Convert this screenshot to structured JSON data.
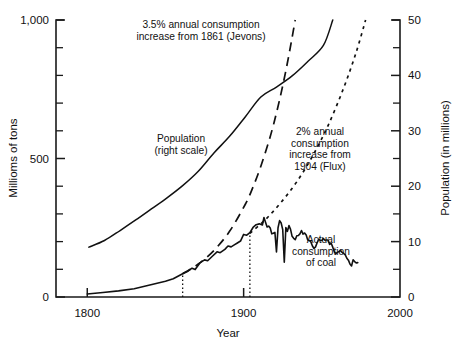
{
  "chart_data": {
    "type": "line",
    "title": "",
    "xlabel": "Year",
    "ylabel_left": "Millioms of tons",
    "ylabel_right": "Population (in millions)",
    "xlim": [
      1780,
      2000
    ],
    "xticks": [
      1800,
      1900,
      2000
    ],
    "xticklabels": [
      "1800",
      "1900",
      "2000"
    ],
    "ylim_left": [
      0,
      1000
    ],
    "yticks_left": [
      0,
      500,
      1000
    ],
    "yticklabels_left": [
      "0",
      "500",
      "1,000"
    ],
    "yticks_left_minor": [
      100,
      200,
      300,
      400,
      600,
      700,
      800,
      900
    ],
    "ylim_right": [
      0,
      50
    ],
    "yticks_right": [
      0,
      10,
      20,
      30,
      40,
      50
    ],
    "yticklabels_right": [
      "0",
      "10",
      "20",
      "30",
      "40",
      "50"
    ],
    "yticks_right_minor": [
      5,
      15,
      25,
      35,
      45
    ],
    "grid": false,
    "legend_position": "inline-annotations",
    "series": [
      {
        "name": "Population (right scale)",
        "style": "solid",
        "axis": "right",
        "units": "millions",
        "points": [
          [
            1801,
            9.0
          ],
          [
            1811,
            10.2
          ],
          [
            1821,
            12.0
          ],
          [
            1831,
            13.9
          ],
          [
            1841,
            15.9
          ],
          [
            1851,
            17.9
          ],
          [
            1861,
            20.1
          ],
          [
            1871,
            22.7
          ],
          [
            1881,
            26.0
          ],
          [
            1891,
            29.0
          ],
          [
            1901,
            32.5
          ],
          [
            1911,
            36.1
          ],
          [
            1921,
            37.9
          ],
          [
            1931,
            39.9
          ],
          [
            1941,
            42.5
          ],
          [
            1951,
            45.4
          ],
          [
            1957,
            50.0
          ]
        ]
      },
      {
        "name": "3.5% annual consumption increase from 1861 (Jevons)",
        "style": "dashed",
        "axis": "left",
        "units": "millions of tons",
        "points": [
          [
            1861,
            84
          ],
          [
            1871,
            119
          ],
          [
            1881,
            168
          ],
          [
            1891,
            237
          ],
          [
            1901,
            334
          ],
          [
            1906,
            397
          ],
          [
            1911,
            472
          ],
          [
            1916,
            560
          ],
          [
            1919,
            620
          ],
          [
            1921,
            665
          ],
          [
            1923,
            712
          ],
          [
            1925,
            763
          ],
          [
            1927,
            817
          ],
          [
            1929,
            875
          ],
          [
            1931,
            937
          ],
          [
            1933,
            1000
          ]
        ]
      },
      {
        "name": "2% annual consumption increase from 1904 (Flux)",
        "style": "dotted",
        "axis": "left",
        "units": "millions of tons",
        "points": [
          [
            1904,
            230
          ],
          [
            1914,
            280
          ],
          [
            1924,
            342
          ],
          [
            1934,
            416
          ],
          [
            1944,
            508
          ],
          [
            1954,
            619
          ],
          [
            1964,
            755
          ],
          [
            1972,
            884
          ],
          [
            1978,
            1000
          ]
        ]
      },
      {
        "name": "Actual consumption of coal",
        "style": "solid-jagged",
        "axis": "left",
        "units": "millions of tons",
        "points": [
          [
            1800,
            11
          ],
          [
            1810,
            16
          ],
          [
            1820,
            22
          ],
          [
            1830,
            30
          ],
          [
            1840,
            43
          ],
          [
            1850,
            57
          ],
          [
            1855,
            66
          ],
          [
            1861,
            84
          ],
          [
            1864,
            92
          ],
          [
            1867,
            104
          ],
          [
            1869,
            99
          ],
          [
            1872,
            123
          ],
          [
            1875,
            134
          ],
          [
            1877,
            131
          ],
          [
            1880,
            147
          ],
          [
            1883,
            163
          ],
          [
            1885,
            160
          ],
          [
            1888,
            172
          ],
          [
            1890,
            184
          ],
          [
            1892,
            181
          ],
          [
            1894,
            188
          ],
          [
            1896,
            195
          ],
          [
            1898,
            202
          ],
          [
            1900,
            226
          ],
          [
            1902,
            223
          ],
          [
            1904,
            232
          ],
          [
            1906,
            251
          ],
          [
            1908,
            261
          ],
          [
            1910,
            264
          ],
          [
            1912,
            260
          ],
          [
            1913,
            287
          ],
          [
            1915,
            253
          ],
          [
            1916,
            256
          ],
          [
            1917,
            249
          ],
          [
            1918,
            228
          ],
          [
            1919,
            230
          ],
          [
            1920,
            233
          ],
          [
            1921,
            163
          ],
          [
            1922,
            250
          ],
          [
            1923,
            276
          ],
          [
            1924,
            267
          ],
          [
            1925,
            243
          ],
          [
            1926,
            126
          ],
          [
            1927,
            251
          ],
          [
            1928,
            237
          ],
          [
            1929,
            258
          ],
          [
            1930,
            244
          ],
          [
            1931,
            219
          ],
          [
            1932,
            212
          ],
          [
            1933,
            207
          ],
          [
            1934,
            221
          ],
          [
            1935,
            222
          ],
          [
            1936,
            228
          ],
          [
            1937,
            240
          ],
          [
            1938,
            227
          ],
          [
            1939,
            231
          ],
          [
            1940,
            224
          ],
          [
            1941,
            206
          ],
          [
            1942,
            204
          ],
          [
            1943,
            199
          ],
          [
            1944,
            184
          ],
          [
            1945,
            175
          ],
          [
            1946,
            181
          ],
          [
            1947,
            196
          ],
          [
            1948,
            209
          ],
          [
            1949,
            204
          ],
          [
            1950,
            204
          ],
          [
            1951,
            211
          ],
          [
            1952,
            205
          ],
          [
            1953,
            206
          ],
          [
            1954,
            206
          ],
          [
            1955,
            190
          ],
          [
            1956,
            194
          ],
          [
            1957,
            180
          ],
          [
            1958,
            163
          ],
          [
            1959,
            157
          ],
          [
            1960,
            161
          ],
          [
            1961,
            164
          ],
          [
            1962,
            168
          ],
          [
            1963,
            161
          ],
          [
            1964,
            157
          ],
          [
            1965,
            152
          ],
          [
            1966,
            140
          ],
          [
            1967,
            133
          ],
          [
            1968,
            119
          ],
          [
            1969,
            112
          ],
          [
            1970,
            134
          ],
          [
            1971,
            128
          ],
          [
            1972,
            123
          ],
          [
            1973,
            124
          ]
        ]
      }
    ],
    "annotations": [
      {
        "id": "jevons-annotation",
        "lines": [
          "3.5% annual consumption",
          "increase from 1861 (Jevons)"
        ],
        "x": 201,
        "y": 28
      },
      {
        "id": "population-annotation",
        "lines": [
          "Population",
          "(right scale)"
        ],
        "x": 181,
        "y": 142
      },
      {
        "id": "flux-annotation",
        "lines": [
          "2% annual",
          "consumption",
          "increase from",
          "1904 (Flux)"
        ],
        "x": 320,
        "y": 135
      },
      {
        "id": "coal-annotation",
        "lines": [
          "Actual",
          "consumption",
          "of coal"
        ],
        "x": 321,
        "y": 243
      }
    ],
    "reference_lines": [
      {
        "id": "marker-1861",
        "x": 1861,
        "style": "dotted"
      },
      {
        "id": "marker-1904",
        "x": 1904,
        "style": "dotted"
      }
    ]
  },
  "colors": {
    "ink": "#111111",
    "background": "#ffffff"
  }
}
